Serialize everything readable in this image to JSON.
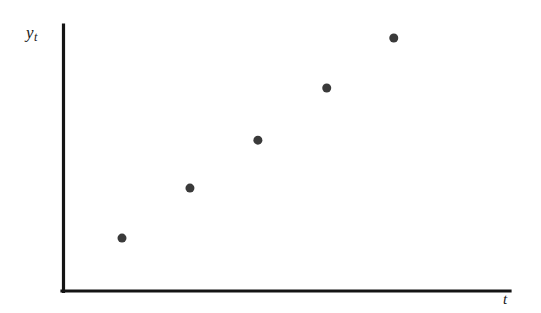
{
  "figure": {
    "background_color": "#ffffff",
    "axis_color": "#141414",
    "marker_color": "#3a3a3a",
    "y_axis_label_base": "y",
    "y_axis_label_sub": "t",
    "x_axis_label_base": "t",
    "x_axis_label_sub": ""
  },
  "chart_data": {
    "type": "scatter",
    "title": "",
    "subtitle": "",
    "xlabel": "t",
    "ylabel": "y_t",
    "grid": false,
    "legend": false,
    "legend_position": "none",
    "annotations": [],
    "xticks": [],
    "yticks": [],
    "xticklabels": [],
    "yticklabels": [],
    "xlim": [
      0,
      1
    ],
    "ylim": [
      0,
      1
    ],
    "marker": "circle",
    "marker_size_px": 9,
    "marker_color": "#3a3a3a",
    "series": [
      {
        "name": "y_t",
        "x": [
          0.132,
          0.284,
          0.436,
          0.59,
          0.74
        ],
        "y": [
          0.199,
          0.387,
          0.567,
          0.763,
          0.951
        ],
        "x_pixels": [
          122,
          190,
          258,
          327,
          394
        ],
        "y_pixels": [
          238,
          188,
          140,
          88,
          38
        ]
      }
    ]
  },
  "axes_geometry": {
    "origin_x_px": 63,
    "origin_y_px": 291,
    "y_axis_top_px": 25,
    "x_axis_right_px": 510
  }
}
